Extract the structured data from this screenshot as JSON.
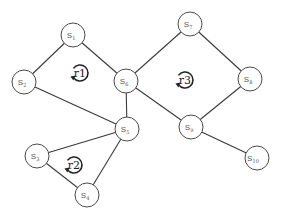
{
  "diagram": {
    "type": "undirected-graph",
    "nodes": [
      {
        "id": "S1",
        "base": "S",
        "sub": "1"
      },
      {
        "id": "S2",
        "base": "S",
        "sub": "2"
      },
      {
        "id": "S3",
        "base": "S",
        "sub": "3"
      },
      {
        "id": "S4",
        "base": "S",
        "sub": "4"
      },
      {
        "id": "S5",
        "base": "S",
        "sub": "5"
      },
      {
        "id": "S6",
        "base": "S",
        "sub": "6"
      },
      {
        "id": "S7",
        "base": "S",
        "sub": "7"
      },
      {
        "id": "S8",
        "base": "S",
        "sub": "8"
      },
      {
        "id": "S9",
        "base": "S",
        "sub": "9"
      },
      {
        "id": "S10",
        "base": "S",
        "sub": "10"
      }
    ],
    "edges": [
      [
        "S1",
        "S2"
      ],
      [
        "S1",
        "S6"
      ],
      [
        "S2",
        "S5"
      ],
      [
        "S6",
        "S5"
      ],
      [
        "S6",
        "S7"
      ],
      [
        "S6",
        "S9"
      ],
      [
        "S7",
        "S8"
      ],
      [
        "S8",
        "S9"
      ],
      [
        "S9",
        "S10"
      ],
      [
        "S5",
        "S3"
      ],
      [
        "S5",
        "S4"
      ],
      [
        "S3",
        "S4"
      ]
    ],
    "regions": [
      {
        "id": "r1",
        "label": "r1",
        "bounded_by": [
          "S1",
          "S2",
          "S5",
          "S6"
        ]
      },
      {
        "id": "r2",
        "label": "r2",
        "bounded_by": [
          "S3",
          "S4",
          "S5"
        ]
      },
      {
        "id": "r3",
        "label": "r3",
        "bounded_by": [
          "S6",
          "S7",
          "S8",
          "S9"
        ]
      }
    ]
  }
}
